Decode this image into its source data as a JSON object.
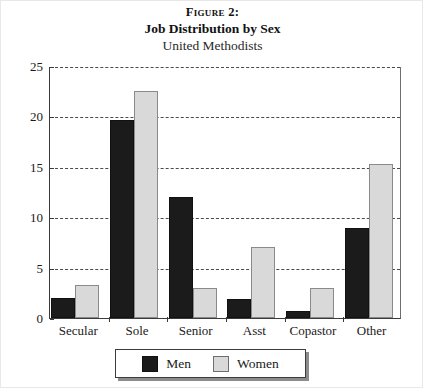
{
  "figure": {
    "number_label": "Figure 2:",
    "title": "Job Distribution by Sex",
    "subtitle": "United Methodists"
  },
  "legend": {
    "entries": [
      {
        "label": "Men",
        "color": "#1b1b1b",
        "swatch_name": "men-swatch"
      },
      {
        "label": "Women",
        "color": "#d9d9d9",
        "swatch_name": "women-swatch"
      }
    ]
  },
  "axes": {
    "y_ticks": [
      "0",
      "5",
      "10",
      "15",
      "20",
      "25"
    ],
    "y_min": 0,
    "y_max": 25,
    "grid": true
  },
  "chart_data": {
    "type": "bar",
    "title": "Job Distribution by Sex",
    "subtitle": "United Methodists",
    "figure_label": "Figure 2:",
    "xlabel": "",
    "ylabel": "",
    "ylim": [
      0,
      25
    ],
    "yticks": [
      0,
      5,
      10,
      15,
      20,
      25
    ],
    "grid": true,
    "legend_position": "bottom",
    "categories": [
      "Secular",
      "Sole",
      "Senior",
      "Asst",
      "Copastor",
      "Other"
    ],
    "series": [
      {
        "name": "Men",
        "color": "#1b1b1b",
        "values": [
          2.0,
          19.6,
          12.0,
          1.9,
          0.7,
          8.9
        ]
      },
      {
        "name": "Women",
        "color": "#d9d9d9",
        "values": [
          3.3,
          22.5,
          3.0,
          7.0,
          3.0,
          15.3
        ]
      }
    ]
  }
}
